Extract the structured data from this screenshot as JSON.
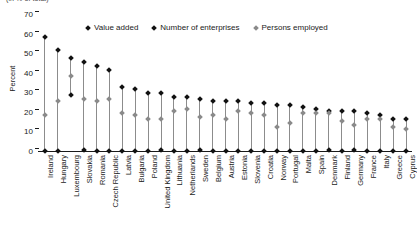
{
  "title_clipped": "(in % of total)",
  "legend": {
    "position": "top-center",
    "items": [
      {
        "label": "Value added",
        "marker": "diamond-marker",
        "color": "#111111"
      },
      {
        "label": "Number of enterprises",
        "marker": "diamond-marker",
        "color": "#111111"
      },
      {
        "label": "Persons employed",
        "marker": "diamond-marker",
        "color": "#8a8a8a"
      }
    ]
  },
  "axes": {
    "ylabel": "Percent",
    "yticks": [
      "0",
      "10",
      "20",
      "30",
      "40",
      "50",
      "60",
      "70"
    ],
    "ylim": [
      0,
      70
    ],
    "xlabel": ""
  },
  "chart_data": {
    "type": "scatter",
    "title": "(in % of total)",
    "xlabel": "",
    "ylabel": "Percent",
    "ylim": [
      0,
      70
    ],
    "grid": false,
    "legend_position": "top-center",
    "categories": [
      "Ireland",
      "Hungary",
      "Luxembourg",
      "Slovakia",
      "Romania",
      "Czech Republic",
      "Latvia",
      "Bulgaria",
      "Poland",
      "United Kingdom",
      "Lithuania",
      "Netherlands",
      "Sweden",
      "Belgium",
      "Austria",
      "Estonia",
      "Slovenia",
      "Croatia",
      "Norway",
      "Portugal",
      "Malta",
      "Spain",
      "Denmark",
      "Finland",
      "Germany",
      "France",
      "Italy",
      "Greece",
      "Cyprus"
    ],
    "series": [
      {
        "name": "Value added",
        "color": "#111111",
        "values": [
          59,
          52,
          48,
          46,
          44,
          42,
          33,
          32,
          30,
          30,
          28,
          28,
          27,
          26,
          26,
          26,
          25,
          25,
          24,
          24,
          23,
          22,
          21,
          21,
          21,
          20,
          19,
          17,
          17
        ]
      },
      {
        "name": "Number of enterprises",
        "color": "#111111",
        "values": [
          0.3,
          0.6,
          29,
          0.8,
          0.5,
          0.4,
          0.4,
          0.3,
          0.3,
          0.8,
          0.4,
          0.5,
          0.8,
          0.6,
          0.5,
          0.5,
          0.4,
          0.3,
          0.4,
          0.3,
          0.6,
          0.4,
          0.8,
          0.6,
          0.8,
          0.5,
          0.3,
          0.3,
          0.4
        ]
      },
      {
        "name": "Persons employed",
        "color": "#8a8a8a",
        "values": [
          19,
          26,
          39,
          27,
          26,
          27,
          20,
          19,
          17,
          17,
          21,
          22,
          18,
          19,
          17,
          21,
          20,
          19,
          13,
          15,
          20,
          20,
          20,
          16,
          14,
          17,
          17,
          13,
          12
        ]
      }
    ]
  }
}
